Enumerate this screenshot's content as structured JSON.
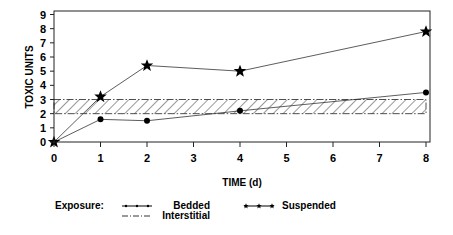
{
  "chart_data": {
    "type": "line",
    "title": "",
    "xlabel": "TIME (d)",
    "ylabel": "TOXIC UNITS",
    "xlim": [
      0,
      8
    ],
    "ylim": [
      0,
      9
    ],
    "x_ticks": [
      "0",
      "1",
      "2",
      "3",
      "4",
      "5",
      "6",
      "7",
      "8"
    ],
    "y_ticks": [
      "0",
      "1",
      "2",
      "3",
      "4",
      "5",
      "6",
      "7",
      "8",
      "9"
    ],
    "grid": false,
    "legend_position": "bottom",
    "legend_title": "Exposure:",
    "series": [
      {
        "name": "Bedded",
        "marker": "circle",
        "x": [
          0,
          1,
          2,
          4,
          8
        ],
        "values": [
          0,
          1.6,
          1.5,
          2.2,
          3.5
        ]
      },
      {
        "name": "Suspended",
        "marker": "star",
        "x": [
          0,
          1,
          2,
          4,
          8
        ],
        "values": [
          0,
          3.2,
          5.4,
          5.0,
          7.8
        ]
      },
      {
        "name": "Interstitial",
        "style": "dash-dot hatched band",
        "band": [
          2,
          3
        ],
        "x_range": [
          0,
          8
        ]
      }
    ]
  }
}
